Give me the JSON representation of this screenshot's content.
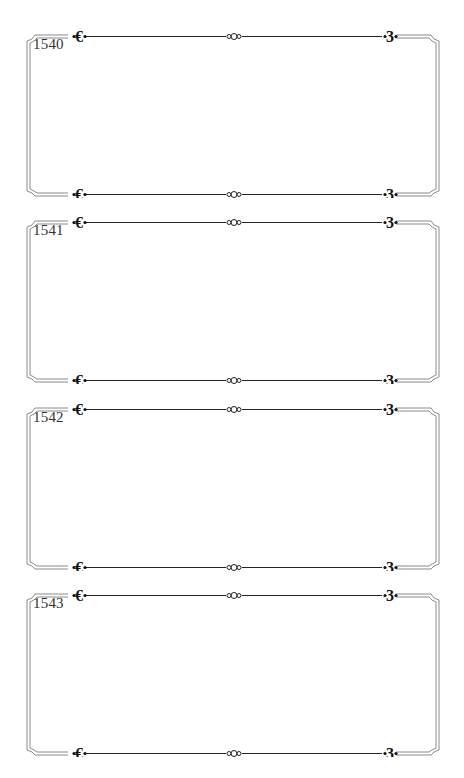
{
  "page": {
    "background": "#ffffff",
    "frame_line_color": "#777777",
    "ornament_color": "#111111"
  },
  "frames": [
    {
      "label": "1540",
      "top": 28
    },
    {
      "label": "1541",
      "top": 214
    },
    {
      "label": "1542",
      "top": 401
    },
    {
      "label": "1543",
      "top": 587
    }
  ]
}
